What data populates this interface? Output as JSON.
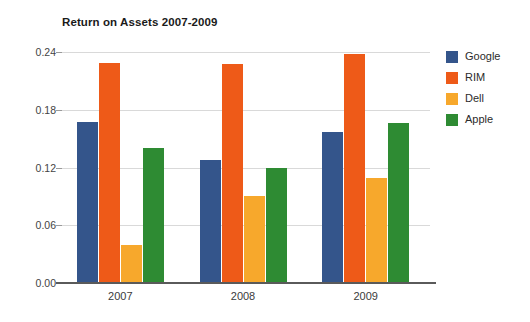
{
  "chart_data": {
    "type": "bar",
    "title": "Return on Assets 2007-2009",
    "xlabel": "",
    "ylabel": "",
    "categories": [
      "2007",
      "2008",
      "2009"
    ],
    "series": [
      {
        "name": "Google",
        "color": "#34558B",
        "values": [
          0.167,
          0.128,
          0.157
        ]
      },
      {
        "name": "RIM",
        "color": "#EE5A18",
        "values": [
          0.229,
          0.228,
          0.238
        ]
      },
      {
        "name": "Dell",
        "color": "#F7A82C",
        "values": [
          0.04,
          0.09,
          0.109
        ]
      },
      {
        "name": "Apple",
        "color": "#2E8B33",
        "values": [
          0.14,
          0.119,
          0.166
        ]
      }
    ],
    "ylim": [
      0.0,
      0.24
    ],
    "yticks": [
      "0.00",
      "0.06",
      "0.12",
      "0.18",
      "0.24"
    ],
    "ytick_values": [
      0.0,
      0.06,
      0.12,
      0.18,
      0.24
    ],
    "grid": true,
    "legend_position": "right",
    "gridline_color": "#d9d9d9",
    "axis_color": "#5a5a5a",
    "background": "#ffffff"
  }
}
